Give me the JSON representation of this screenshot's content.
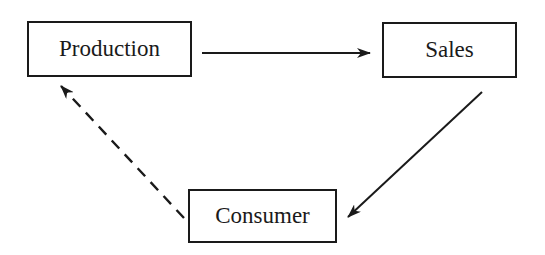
{
  "diagram": {
    "nodes": [
      {
        "id": "production",
        "label": "Production"
      },
      {
        "id": "sales",
        "label": "Sales"
      },
      {
        "id": "consumer",
        "label": "Consumer"
      }
    ],
    "edges": [
      {
        "from": "production",
        "to": "sales",
        "style": "solid"
      },
      {
        "from": "sales",
        "to": "consumer",
        "style": "solid"
      },
      {
        "from": "consumer",
        "to": "production",
        "style": "dashed"
      }
    ],
    "colors": {
      "stroke": "#1a1a1a",
      "background": "#ffffff"
    }
  }
}
